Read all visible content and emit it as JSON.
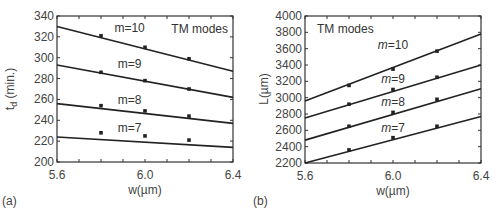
{
  "chart_data": [
    {
      "panel": "(a)",
      "type": "line",
      "title": "",
      "annotation": "TM modes",
      "xlabel": "w(µm)",
      "ylabel": "t_d (min.)",
      "ylabel_main": "t",
      "ylabel_sub": "d",
      "ylabel_rest": " (min.)",
      "xlim": [
        5.6,
        6.4
      ],
      "ylim": [
        200,
        340
      ],
      "xticks": [
        5.6,
        6.0,
        6.4
      ],
      "xtick_labels": [
        "5.6",
        "6.0",
        "6.4"
      ],
      "yticks": [
        200,
        220,
        240,
        260,
        280,
        300,
        320,
        340
      ],
      "ytick_labels": [
        "200",
        "220",
        "240",
        "260",
        "280",
        "300",
        "320",
        "340"
      ],
      "grid": false,
      "series": [
        {
          "name": "m=10",
          "line_x": [
            5.6,
            6.4
          ],
          "line_y": [
            330,
            287
          ],
          "points_x": [
            5.8,
            6.0,
            6.2
          ],
          "points_y": [
            321,
            310,
            299
          ],
          "label_pos": [
            5.93,
            325
          ]
        },
        {
          "name": "m=9",
          "line_x": [
            5.6,
            6.4
          ],
          "line_y": [
            293,
            262
          ],
          "points_x": [
            5.8,
            6.0,
            6.2
          ],
          "points_y": [
            286,
            278,
            270
          ],
          "label_pos": [
            5.93,
            290
          ]
        },
        {
          "name": "m=8",
          "line_x": [
            5.6,
            6.4
          ],
          "line_y": [
            256,
            237
          ],
          "points_x": [
            5.8,
            6.0,
            6.2
          ],
          "points_y": [
            254,
            249,
            244
          ],
          "label_pos": [
            5.93,
            256
          ]
        },
        {
          "name": "m=7",
          "line_x": [
            5.6,
            6.4
          ],
          "line_y": [
            224,
            214
          ],
          "points_x": [
            5.8,
            6.0,
            6.2
          ],
          "points_y": [
            228,
            225,
            221
          ],
          "label_pos": [
            5.93,
            229
          ]
        }
      ]
    },
    {
      "panel": "(b)",
      "type": "line",
      "title": "",
      "annotation": "TM modes",
      "xlabel": "w(µm)",
      "ylabel": "L(µm)",
      "xlim": [
        5.6,
        6.4
      ],
      "ylim": [
        2200,
        4000
      ],
      "xticks": [
        5.6,
        6.0,
        6.4
      ],
      "xtick_labels": [
        "5.6",
        "6.0",
        "6.4"
      ],
      "yticks": [
        2200,
        2400,
        2600,
        2800,
        3000,
        3200,
        3400,
        3600,
        3800,
        4000
      ],
      "ytick_labels": [
        "2200",
        "2400",
        "2600",
        "2800",
        "3000",
        "3200",
        "3400",
        "3600",
        "3800",
        "4000"
      ],
      "grid": false,
      "series": [
        {
          "name": "m=10",
          "line_x": [
            5.6,
            6.4
          ],
          "line_y": [
            2960,
            3780
          ],
          "points_x": [
            5.8,
            6.0,
            6.2
          ],
          "points_y": [
            3150,
            3350,
            3570
          ],
          "label_pos": [
            6.0,
            3600
          ]
        },
        {
          "name": "m=9",
          "line_x": [
            5.6,
            6.4
          ],
          "line_y": [
            2750,
            3400
          ],
          "points_x": [
            5.8,
            6.0,
            6.2
          ],
          "points_y": [
            2920,
            3100,
            3250
          ],
          "label_pos": [
            6.0,
            3180
          ]
        },
        {
          "name": "m=8",
          "line_x": [
            5.6,
            6.4
          ],
          "line_y": [
            2480,
            3110
          ],
          "points_x": [
            5.8,
            6.0,
            6.2
          ],
          "points_y": [
            2650,
            2820,
            2980
          ],
          "label_pos": [
            6.0,
            2900
          ]
        },
        {
          "name": "m=7",
          "line_x": [
            5.6,
            6.4
          ],
          "line_y": [
            2200,
            2770
          ],
          "points_x": [
            5.8,
            6.0,
            6.2
          ],
          "points_y": [
            2360,
            2510,
            2650
          ],
          "label_pos": [
            6.0,
            2580
          ]
        }
      ]
    }
  ]
}
